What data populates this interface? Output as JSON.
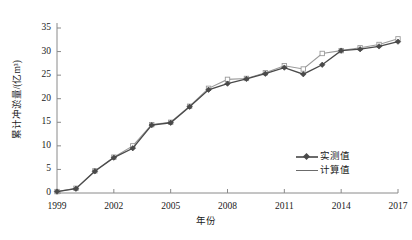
{
  "chart_data": {
    "type": "line",
    "title": "",
    "xlabel": "年份",
    "ylabel": "累计冲淤量/(亿m³)",
    "xlim": [
      1999,
      2017
    ],
    "ylim": [
      0,
      35
    ],
    "yticks": [
      "0",
      "5",
      "10",
      "15",
      "20",
      "25",
      "30",
      "35"
    ],
    "ytick_values": [
      0,
      5,
      10,
      15,
      20,
      25,
      30,
      35
    ],
    "xticks": [
      "1999",
      "2002",
      "2005",
      "2008",
      "2011",
      "2014",
      "2017"
    ],
    "xtick_values": [
      1999,
      2002,
      2005,
      2008,
      2011,
      2014,
      2017
    ],
    "grid": false,
    "legend_position": "lower-right",
    "x": [
      1999,
      2000,
      2001,
      2002,
      2003,
      2004,
      2005,
      2006,
      2007,
      2008,
      2009,
      2010,
      2011,
      2012,
      2013,
      2014,
      2015,
      2016,
      2017
    ],
    "series": [
      {
        "name": "实测值",
        "marker": "diamond",
        "color": "#4a4a4a",
        "values": [
          0.3,
          0.9,
          4.6,
          7.5,
          9.5,
          14.4,
          14.9,
          18.3,
          21.9,
          23.2,
          24.2,
          25.3,
          26.6,
          25.2,
          27.2,
          30.2,
          30.5,
          31.1,
          32.1
        ]
      },
      {
        "name": "计算值",
        "marker": "square",
        "color": "#9a9a9a",
        "values": [
          0.3,
          1.0,
          4.7,
          7.6,
          10.0,
          14.5,
          15.0,
          18.4,
          22.2,
          24.1,
          24.3,
          25.5,
          27.0,
          26.3,
          29.6,
          30.2,
          30.8,
          31.5,
          32.7
        ]
      }
    ]
  },
  "legend": {
    "items": [
      {
        "label": "实测值"
      },
      {
        "label": "计算值"
      }
    ]
  },
  "axes": {
    "y_title": "累计冲淤量/(亿m³)",
    "x_title": "年份"
  }
}
